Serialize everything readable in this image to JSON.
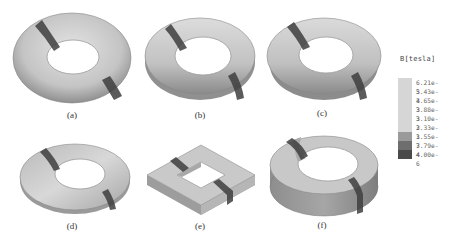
{
  "figure": {
    "panels": [
      {
        "id": "a",
        "caption": "(a)",
        "shape": "torus-circular-section"
      },
      {
        "id": "b",
        "caption": "(b)",
        "shape": "torus-rounded-section"
      },
      {
        "id": "c",
        "caption": "(c)",
        "shape": "torus-trapezoidal-section"
      },
      {
        "id": "d",
        "caption": "(d)",
        "shape": "conical-washer"
      },
      {
        "id": "e",
        "caption": "(e)",
        "shape": "square-frame"
      },
      {
        "id": "f",
        "caption": "(f)",
        "shape": "rectangular-section-ring"
      }
    ]
  },
  "legend": {
    "title": "B[tesla]",
    "entries": [
      {
        "label": "6.21e-3",
        "color": "#d6d6d6"
      },
      {
        "label": "5.43e-3",
        "color": "#d6d6d6"
      },
      {
        "label": "4.65e-3",
        "color": "#d6d6d6"
      },
      {
        "label": "3.88e-3",
        "color": "#d6d6d6"
      },
      {
        "label": "3.10e-3",
        "color": "#d6d6d6"
      },
      {
        "label": "2.33e-3",
        "color": "#d6d6d6"
      },
      {
        "label": "1.55e-3",
        "color": "#9a9a9a"
      },
      {
        "label": "7.79e-4",
        "color": "#6e6e6e"
      },
      {
        "label": "4.00e-6",
        "color": "#4a4a4a"
      }
    ]
  },
  "colors": {
    "body_light": "#cfcfcf",
    "body_mid": "#a9a9a9",
    "body_dark": "#7a7a7a",
    "band_dark": "#3e3e3e",
    "background": "#ffffff"
  }
}
